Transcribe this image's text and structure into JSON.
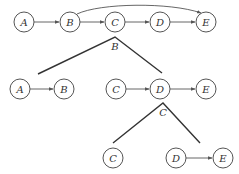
{
  "diagram": {
    "top_row": {
      "nodes": [
        {
          "id": "A",
          "label": "A",
          "x": 24,
          "y": 22
        },
        {
          "id": "B",
          "label": "B",
          "x": 70,
          "y": 22
        },
        {
          "id": "C",
          "label": "C",
          "x": 115,
          "y": 22
        },
        {
          "id": "D",
          "label": "D",
          "x": 160,
          "y": 22
        },
        {
          "id": "E",
          "label": "E",
          "x": 206,
          "y": 22
        }
      ],
      "edges": [
        [
          "A",
          "B"
        ],
        [
          "B",
          "C"
        ],
        [
          "C",
          "D"
        ],
        [
          "D",
          "E"
        ]
      ],
      "curved_edges": [
        [
          "B",
          "E"
        ]
      ]
    },
    "split_1": {
      "label": "B",
      "apex": [
        115,
        37
      ]
    },
    "middle_left": {
      "nodes": [
        {
          "id": "A",
          "label": "A",
          "x": 20,
          "y": 89
        },
        {
          "id": "B",
          "label": "B",
          "x": 64,
          "y": 89
        }
      ],
      "edges": [
        [
          "A",
          "B"
        ]
      ]
    },
    "middle_right": {
      "nodes": [
        {
          "id": "C",
          "label": "C",
          "x": 116,
          "y": 89
        },
        {
          "id": "D",
          "label": "D",
          "x": 160,
          "y": 89
        },
        {
          "id": "E",
          "label": "E",
          "x": 206,
          "y": 89
        }
      ],
      "edges": [
        [
          "C",
          "D"
        ],
        [
          "D",
          "E"
        ]
      ]
    },
    "split_2": {
      "label": "C",
      "apex": [
        163,
        103
      ]
    },
    "bottom_left": {
      "nodes": [
        {
          "id": "C",
          "label": "C",
          "x": 113,
          "y": 158
        }
      ],
      "edges": []
    },
    "bottom_right": {
      "nodes": [
        {
          "id": "D",
          "label": "D",
          "x": 176,
          "y": 158
        },
        {
          "id": "E",
          "label": "E",
          "x": 223,
          "y": 158
        }
      ],
      "edges": [
        [
          "D",
          "E"
        ]
      ]
    },
    "colors": {
      "stroke": "#555555",
      "branch": "#333333",
      "text": "#333333",
      "background": "#ffffff"
    }
  }
}
